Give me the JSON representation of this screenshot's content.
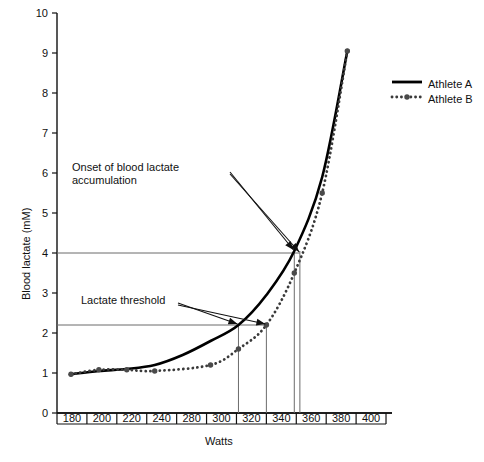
{
  "chart_data": {
    "type": "line",
    "title": "",
    "xlabel": "Watts",
    "ylabel": "Blood lactate (mM)",
    "xlim": [
      170,
      410
    ],
    "ylim": [
      0,
      10
    ],
    "xticks": [
      180,
      200,
      220,
      240,
      280,
      300,
      320,
      340,
      360,
      380,
      400
    ],
    "xtick_labels": [
      "180",
      "200",
      "220",
      "240",
      "280",
      "300",
      "320",
      "340",
      "360",
      "380",
      "400"
    ],
    "yticks": [
      0,
      1,
      2,
      3,
      4,
      5,
      6,
      7,
      8,
      9,
      10
    ],
    "ytick_labels": [
      "0",
      "1",
      "2",
      "3",
      "4",
      "5",
      "6",
      "7",
      "8",
      "9",
      "10"
    ],
    "grid": false,
    "legend_position": "right",
    "series": [
      {
        "name": "Athlete A",
        "style": "solid",
        "color": "#000000",
        "markers": false,
        "x": [
          180,
          200,
          220,
          240,
          260,
          280,
          300,
          320,
          340,
          360,
          378
        ],
        "values": [
          0.97,
          1.05,
          1.1,
          1.2,
          1.45,
          1.8,
          2.2,
          2.95,
          4.05,
          5.9,
          9.05
        ]
      },
      {
        "name": "Athlete B",
        "style": "dotted",
        "color": "#3a3a3a",
        "markers": true,
        "x": [
          180,
          200,
          220,
          240,
          280,
          300,
          320,
          340,
          360,
          378
        ],
        "values": [
          0.97,
          1.08,
          1.08,
          1.05,
          1.2,
          1.6,
          2.2,
          3.5,
          5.5,
          9.05
        ]
      }
    ],
    "reference_lines": [
      {
        "name": "obla-level",
        "orientation": "horizontal",
        "value": 4.0,
        "label": "Onset of blood lactate accumulation"
      },
      {
        "name": "lactate-threshold-level",
        "orientation": "horizontal",
        "value": 2.2,
        "label": "Lactate threshold"
      },
      {
        "name": "athlete-a-threshold-watts",
        "orientation": "vertical",
        "value": 300
      },
      {
        "name": "athlete-b-threshold-watts",
        "orientation": "vertical",
        "value": 320
      },
      {
        "name": "athlete-a-obla-watts",
        "orientation": "vertical",
        "value": 340
      },
      {
        "name": "athlete-b-obla-watts",
        "orientation": "vertical",
        "value": 344
      }
    ],
    "annotations": [
      {
        "name": "obla-annotation",
        "text": "Onset of blood lactate\naccumulation",
        "points_to": [
          [
            340,
            4.05
          ],
          [
            344,
            4.05
          ]
        ]
      },
      {
        "name": "lactate-threshold-annotation",
        "text": "Lactate threshold",
        "points_to": [
          [
            300,
            2.2
          ],
          [
            320,
            2.2
          ]
        ]
      }
    ],
    "legend": [
      {
        "label": "Athlete A",
        "style": "solid"
      },
      {
        "label": "Athlete B",
        "style": "dotted"
      }
    ]
  }
}
